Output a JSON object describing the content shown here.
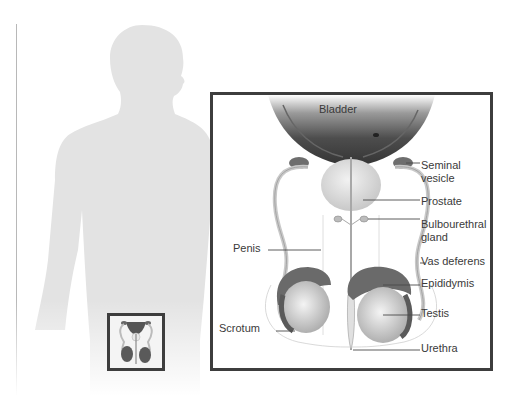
{
  "diagram": {
    "colors": {
      "silhouette": "#e3e3e3",
      "box_border": "#3d3d3d",
      "bladder_dark": "#4a4a4a",
      "organ_light": "#dcdcdc",
      "tissue_dark": "#6a6a6a",
      "label_text": "#3a3a3a",
      "leader_line": "#4a4a4a"
    },
    "labels": {
      "bladder": "Bladder",
      "seminal_vesicle_1": "Seminal",
      "seminal_vesicle_2": "vesicle",
      "prostate": "Prostate",
      "bulbourethral_1": "Bulbourethral",
      "bulbourethral_2": "gland",
      "vas_deferens": "Vas deferens",
      "epididymis": "Epididymis",
      "testis": "Testis",
      "urethra": "Urethra",
      "penis": "Penis",
      "scrotum": "Scrotum"
    },
    "inset": {
      "description": "Thumbnail locator of reproductive organs on body silhouette"
    }
  }
}
